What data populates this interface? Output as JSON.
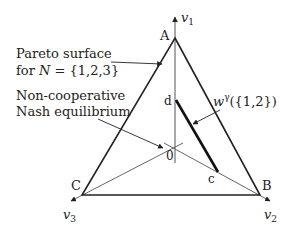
{
  "diagram": {
    "axes": {
      "v1": "v",
      "v1_sub": "1",
      "v2": "v",
      "v2_sub": "2",
      "v3": "v",
      "v3_sub": "3"
    },
    "vertices": {
      "A": "A",
      "B": "B",
      "C": "C"
    },
    "points": {
      "origin": "0",
      "c": "c",
      "d": "d"
    },
    "annotations": {
      "pareto_line1": "Pareto surface",
      "pareto_line2_prefix": "for ",
      "pareto_line2_N": "N",
      "pareto_line2_set": " = {1,2,3}",
      "nash_line1": "Non-cooperative",
      "nash_line2": "Nash equilibrium",
      "w_symbol": "w",
      "w_sup": "γ",
      "w_arg": "({1,2})"
    },
    "colors": {
      "line": "#222222",
      "axis": "#444444"
    }
  }
}
